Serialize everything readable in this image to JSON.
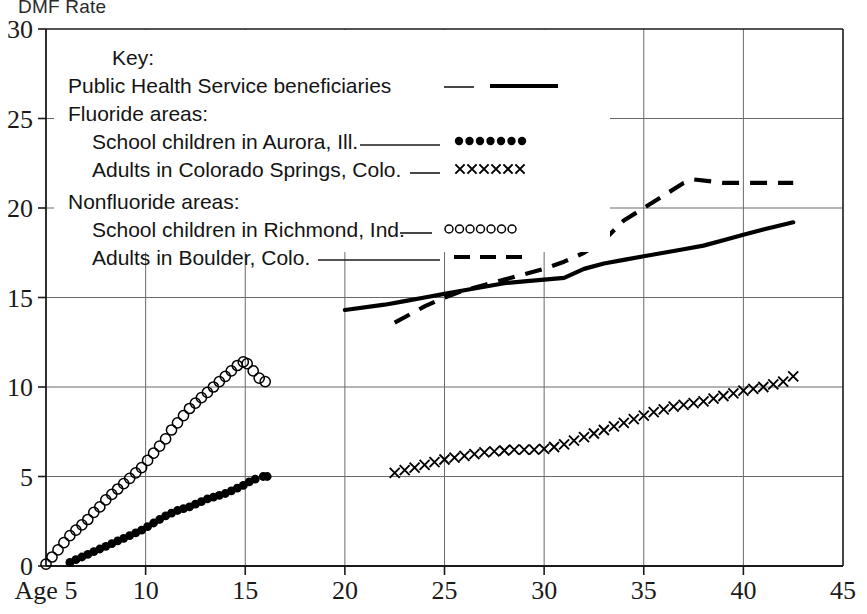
{
  "axis_title": "DMF Rate",
  "legend": {
    "title": "Key:",
    "entries": [
      {
        "label": "Public Health Service beneficiaries",
        "marker": "solid-line",
        "leader": "___"
      },
      {
        "label": "Fluoride areas:",
        "marker": "group-header",
        "leader": ""
      },
      {
        "label": "School children in Aurora, Ill.",
        "marker": "filled-circles",
        "leader": "______"
      },
      {
        "label": "Adults in Colorado Springs, Colo.",
        "marker": "x-marks",
        "leader": "__"
      },
      {
        "label": "Nonfluoride areas:",
        "marker": "group-header",
        "leader": ""
      },
      {
        "label": "School children in Richmond, Ind.",
        "marker": "open-circles",
        "leader": "__"
      },
      {
        "label": "Adults in Boulder, Colo.",
        "marker": "dashed-line",
        "leader": "__________"
      }
    ]
  },
  "chart_data": {
    "type": "line",
    "title": "DMF Rate",
    "xlabel": "Age",
    "ylabel": "DMF Rate",
    "xlim": [
      5,
      45
    ],
    "ylim": [
      0,
      30
    ],
    "grid": true,
    "legend_position": "upper-left-inside",
    "xticks": [
      5,
      10,
      15,
      20,
      25,
      30,
      35,
      40,
      45
    ],
    "xtick_labels": [
      "Age 5",
      "10",
      "15",
      "20",
      "25",
      "30",
      "35",
      "40",
      "45"
    ],
    "yticks": [
      0,
      5,
      10,
      15,
      20,
      25,
      30
    ],
    "ytick_labels": [
      "0",
      "5",
      "10",
      "15",
      "20",
      "25",
      "30"
    ],
    "series": [
      {
        "name": "Public Health Service beneficiaries",
        "marker": "solid-line",
        "style": "solid",
        "x": [
          20,
          22,
          23,
          24,
          25,
          26,
          27,
          28,
          29,
          30,
          31,
          32,
          33,
          34,
          35,
          36,
          37,
          38,
          39,
          40,
          41,
          42.5
        ],
        "values": [
          14.3,
          14.6,
          14.8,
          15.0,
          15.2,
          15.4,
          15.6,
          15.8,
          15.9,
          16.0,
          16.1,
          16.6,
          16.9,
          17.1,
          17.3,
          17.5,
          17.7,
          17.9,
          18.2,
          18.5,
          18.8,
          19.2
        ]
      },
      {
        "name": "Adults in Boulder, Colo.",
        "marker": "dashed-line",
        "style": "dashed",
        "x": [
          22.5,
          24,
          25,
          26,
          27,
          28,
          29,
          30,
          31,
          32,
          33,
          34,
          35,
          36,
          37,
          37.5,
          39,
          40,
          41,
          42.5
        ],
        "values": [
          13.6,
          14.5,
          15.0,
          15.4,
          15.7,
          16.0,
          16.3,
          16.6,
          17.0,
          17.5,
          18.2,
          19.3,
          20.0,
          20.7,
          21.4,
          21.6,
          21.4,
          21.4,
          21.4,
          21.4
        ]
      },
      {
        "name": "School children in Richmond, Ind.",
        "marker": "open-circles",
        "style": "markers",
        "x": [
          5,
          5.3,
          5.6,
          5.9,
          6.2,
          6.5,
          6.8,
          7.1,
          7.4,
          7.7,
          8,
          8.3,
          8.6,
          8.9,
          9.2,
          9.5,
          9.8,
          10.1,
          10.4,
          10.7,
          11,
          11.3,
          11.6,
          11.9,
          12.2,
          12.5,
          12.8,
          13.1,
          13.4,
          13.7,
          14,
          14.3,
          14.6,
          14.9,
          15.1,
          15.4,
          15.7,
          16
        ],
        "values": [
          0.1,
          0.5,
          0.9,
          1.3,
          1.7,
          2.0,
          2.3,
          2.6,
          3.0,
          3.3,
          3.7,
          4.0,
          4.3,
          4.6,
          4.9,
          5.2,
          5.5,
          5.9,
          6.3,
          6.7,
          7.1,
          7.6,
          8.0,
          8.4,
          8.8,
          9.1,
          9.4,
          9.7,
          10.0,
          10.3,
          10.6,
          10.9,
          11.2,
          11.4,
          11.3,
          10.9,
          10.5,
          10.3
        ]
      },
      {
        "name": "School children in Aurora, Ill.",
        "marker": "filled-circles",
        "style": "markers",
        "x": [
          6.2,
          6.5,
          6.8,
          7.1,
          7.4,
          7.7,
          8,
          8.3,
          8.6,
          8.9,
          9.2,
          9.5,
          9.8,
          10.1,
          10.4,
          10.7,
          11,
          11.3,
          11.6,
          11.9,
          12.2,
          12.5,
          12.8,
          13.1,
          13.4,
          13.7,
          14,
          14.3,
          14.6,
          14.9,
          15.2,
          15.5,
          15.9,
          16.1
        ],
        "values": [
          0.2,
          0.35,
          0.5,
          0.65,
          0.8,
          0.95,
          1.1,
          1.25,
          1.4,
          1.55,
          1.7,
          1.85,
          2.0,
          2.2,
          2.4,
          2.6,
          2.8,
          2.95,
          3.1,
          3.2,
          3.3,
          3.45,
          3.6,
          3.75,
          3.85,
          3.95,
          4.05,
          4.2,
          4.35,
          4.5,
          4.7,
          4.85,
          5.0,
          5.0
        ]
      },
      {
        "name": "Adults in Colorado Springs, Colo.",
        "marker": "x-marks",
        "style": "markers",
        "x": [
          22.5,
          23,
          23.5,
          24,
          24.5,
          25,
          25.5,
          26,
          26.5,
          27,
          27.5,
          28,
          28.5,
          29,
          29.5,
          30,
          30.5,
          31,
          31.5,
          32,
          32.5,
          33,
          33.5,
          34,
          34.5,
          35,
          35.5,
          36,
          36.5,
          37,
          37.5,
          38,
          38.5,
          39,
          39.5,
          40,
          40.5,
          41,
          41.5,
          42,
          42.5
        ],
        "values": [
          5.2,
          5.35,
          5.5,
          5.65,
          5.8,
          5.95,
          6.05,
          6.15,
          6.25,
          6.35,
          6.4,
          6.45,
          6.5,
          6.5,
          6.5,
          6.55,
          6.65,
          6.8,
          7.0,
          7.2,
          7.4,
          7.6,
          7.8,
          8.0,
          8.2,
          8.4,
          8.6,
          8.75,
          8.9,
          9.0,
          9.1,
          9.2,
          9.35,
          9.5,
          9.65,
          9.8,
          9.9,
          10.0,
          10.15,
          10.3,
          10.6
        ]
      }
    ]
  }
}
